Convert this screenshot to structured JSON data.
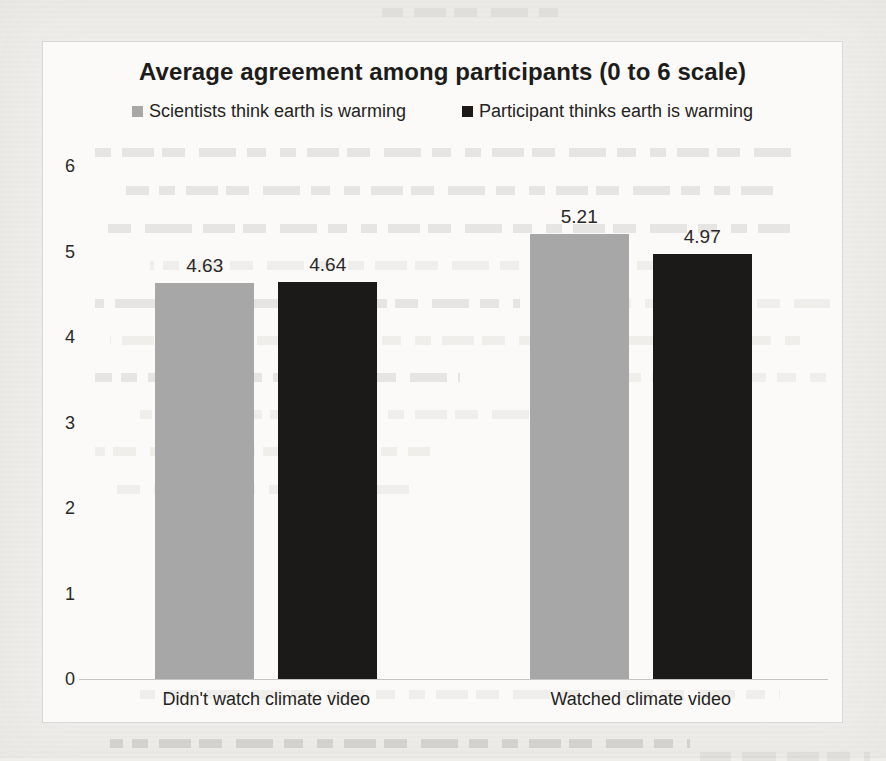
{
  "page": {
    "background_color": "#efeeeb",
    "chart_background_color": "#fbfaf8",
    "border_color": "#d9d8d4",
    "axis_line_color": "#c6c5c1"
  },
  "chart_data": {
    "type": "bar",
    "title": "Average agreement among participants (0 to 6 scale)",
    "categories": [
      "Didn't watch climate video",
      "Watched climate video"
    ],
    "series": [
      {
        "name": "Scientists think earth is warming",
        "color": "#a7a7a7",
        "values": [
          4.63,
          5.21
        ]
      },
      {
        "name": "Participant thinks earth is warming",
        "color": "#1b1a19",
        "values": [
          4.64,
          4.97
        ]
      }
    ],
    "value_labels": [
      [
        "4.63",
        "4.64"
      ],
      [
        "5.21",
        "4.97"
      ]
    ],
    "xlabel": "",
    "ylabel": "",
    "ylim": [
      0,
      6
    ],
    "y_ticks": [
      6,
      5,
      4,
      3,
      2,
      1,
      0
    ],
    "grid": false,
    "legend_position": "top"
  }
}
